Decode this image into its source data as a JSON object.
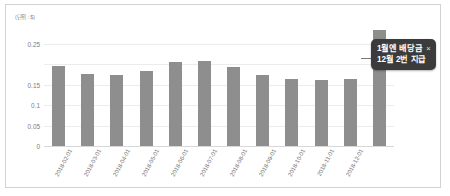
{
  "chart_data": {
    "type": "bar",
    "title": "",
    "unit_label": "(단위 : $)",
    "xlabel": "",
    "ylabel": "",
    "ylim": [
      0,
      0.3
    ],
    "grid": true,
    "legend": "none",
    "ytick_values": [
      0,
      0.05,
      0.1,
      0.15,
      0.2,
      0.25
    ],
    "ytick_labels": [
      "0",
      "0.05",
      "0.1",
      "0.15",
      "",
      "0.25"
    ],
    "categories": [
      "2018-02-01",
      "2018-03-01",
      "2018-04-01",
      "2018-05-01",
      "2018-06-01",
      "2018-07-01",
      "2018-08-01",
      "2018-09-01",
      "2018-10-01",
      "2018-11-01",
      "2018-12-01",
      ""
    ],
    "values": [
      0.195,
      0.175,
      0.172,
      0.183,
      0.205,
      0.208,
      0.192,
      0.174,
      0.164,
      0.162,
      0.164,
      0.283
    ],
    "bar_color": "#8e8e8e",
    "annotations": [
      {
        "line1": "1월엔 배당금",
        "close": "×",
        "line2": "12월 2번 지급",
        "background": "#3b3b3b",
        "text_color": "#ffffff",
        "target_series_index": 11
      }
    ]
  },
  "frame": {
    "border_color": "#d2d2d2",
    "background": "#ffffff"
  }
}
